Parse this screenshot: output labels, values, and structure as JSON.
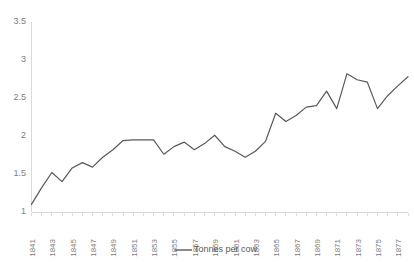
{
  "chart_data": {
    "type": "line",
    "title": "",
    "subtitle": "",
    "xlabel": "",
    "ylabel": "",
    "grid": false,
    "legend_position": "bottom-center",
    "ylim": [
      1,
      3.5
    ],
    "ytick_labels": [
      "1",
      "1.5",
      "2",
      "2.5",
      "3",
      "3.5"
    ],
    "ytick_values": [
      1,
      1.5,
      2,
      2.5,
      3,
      3.5
    ],
    "xlim": [
      1841,
      1878
    ],
    "xtick_labels": [
      "1841",
      "1843",
      "1845",
      "1847",
      "1849",
      "1851",
      "1853",
      "1855",
      "1857",
      "1859",
      "1861",
      "1863",
      "1865",
      "1867",
      "1869",
      "1871",
      "1873",
      "1875",
      "1877"
    ],
    "x": [
      1841,
      1842,
      1843,
      1844,
      1845,
      1846,
      1847,
      1848,
      1849,
      1850,
      1851,
      1852,
      1853,
      1854,
      1855,
      1856,
      1857,
      1858,
      1859,
      1860,
      1861,
      1862,
      1863,
      1864,
      1865,
      1866,
      1867,
      1868,
      1869,
      1870,
      1871,
      1872,
      1873,
      1874,
      1875,
      1876,
      1877,
      1878
    ],
    "series": [
      {
        "name": "Tonnes per cow",
        "color": "#595959",
        "values": [
          1.1,
          1.32,
          1.52,
          1.4,
          1.58,
          1.65,
          1.59,
          1.72,
          1.82,
          1.94,
          1.95,
          1.95,
          1.95,
          1.76,
          1.86,
          1.92,
          1.82,
          1.9,
          2.01,
          1.86,
          1.8,
          1.72,
          1.8,
          1.93,
          2.3,
          2.19,
          2.27,
          2.38,
          2.4,
          2.59,
          2.36,
          2.82,
          2.74,
          2.71,
          2.36,
          2.53,
          2.66,
          2.78
        ]
      }
    ],
    "legend": [
      {
        "label": "Tonnes per cow",
        "color": "#595959"
      }
    ]
  },
  "axis_colors": {
    "axis_line": "#d9d9d9",
    "tick_text": "#808080",
    "series": "#595959"
  }
}
